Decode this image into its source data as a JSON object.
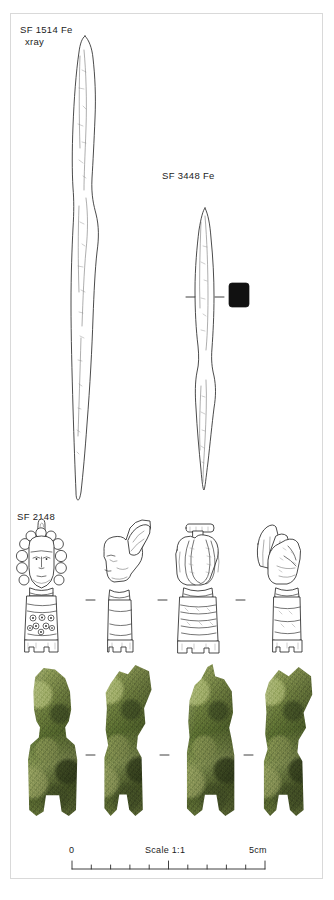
{
  "figure": {
    "kind": "archaeological-finds-plate",
    "background": "#ffffff",
    "frame_color": "#d9d9d9"
  },
  "labels": {
    "find_1_line1": "SF 1514 Fe",
    "find_1_line2": "xray",
    "find_2": "SF 3448 Fe",
    "find_3": "SF 2148"
  },
  "scale": {
    "zero": "0",
    "caption": "Scale 1:1",
    "max": "5cm",
    "ticks_total": 10,
    "major_ticks": [
      0,
      5,
      10
    ]
  },
  "objects": [
    {
      "id": "SF 1514 Fe",
      "material": "Fe",
      "rendering": "xray",
      "type": "line-drawing",
      "description": "elongated tapering iron object"
    },
    {
      "id": "SF 3448 Fe",
      "material": "Fe",
      "rendering": "line-drawing",
      "description": "slender double-pointed iron blade with solid square cross-section"
    },
    {
      "id": "SF 2148",
      "rendering": "line-drawing-and-photograph",
      "views": 4,
      "description": "copper-alloy figurine head and shaft with ring-and-dot decoration"
    }
  ],
  "colors": {
    "ink": "#1c1c1c",
    "patina_light": "#9caa68",
    "patina_mid": "#6d7c42",
    "patina_dark": "#4d5c2b",
    "cross_section_fill": "#111111"
  }
}
